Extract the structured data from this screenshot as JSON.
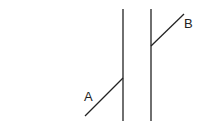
{
  "diagram": {
    "type": "poggendorff-illusion",
    "stroke_color": "#222222",
    "background": "#ffffff",
    "vertical_lines": [
      {
        "x": 123,
        "y1": 9,
        "y2": 121
      },
      {
        "x": 151,
        "y1": 9,
        "y2": 121
      }
    ],
    "segments": [
      {
        "label": "A",
        "x1": 85,
        "y1": 116,
        "x2": 123,
        "y2": 78,
        "label_x": 84,
        "label_y": 101
      },
      {
        "label": "B",
        "x1": 151,
        "y1": 46,
        "x2": 184,
        "y2": 14,
        "label_x": 184,
        "label_y": 28
      }
    ]
  }
}
